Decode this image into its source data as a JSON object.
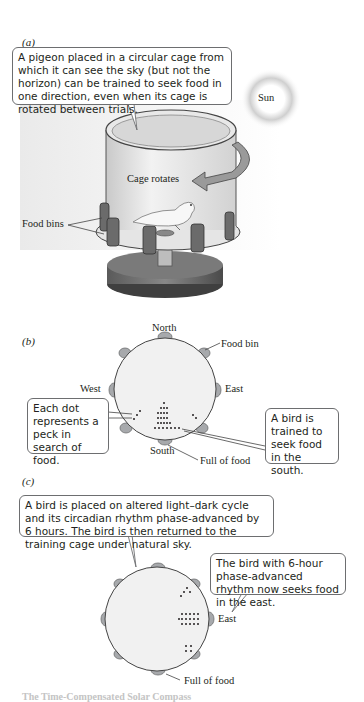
{
  "panels": {
    "a": {
      "label": "(a)",
      "callout": "A pigeon placed in a circular cage from which it can see the sky (but not the horizon) can be trained to seek food in one direction, even when its cage is rotated between trials.",
      "sun_label": "Sun",
      "cage_rotates_label": "Cage rotates",
      "food_bins_label": "Food bins"
    },
    "b": {
      "label": "(b)",
      "north": "North",
      "west": "West",
      "east": "East",
      "south": "South",
      "food_bin": "Food bin",
      "full_of_food": "Full of food",
      "left_callout": "Each dot represents a peck in search of food.",
      "right_callout": "A bird is trained to seek food in the south."
    },
    "c": {
      "label": "(c)",
      "top_callout": "A bird is placed on altered light–dark cycle and its circadian rhythm phase-advanced by 6 hours. The bird is then returned to the training cage under natural sky.",
      "right_callout": "The bird with 6-hour phase-advanced rhythm now seeks food in the east.",
      "east": "East",
      "full_of_food": "Full of food"
    }
  },
  "caption_partial": "The Time-Compensated Solar Compass"
}
